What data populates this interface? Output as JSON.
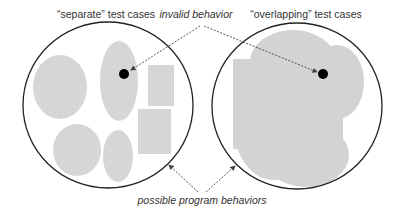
{
  "labels": {
    "separate": "“separate” test cases",
    "invalid": "invalid behavior",
    "overlapping": "“overlapping” test cases",
    "possible": "possible program behaviors"
  },
  "colors": {
    "shape_fill": "#d6d6d6",
    "overlap_fill": "#b5b5b5",
    "outline": "#222222",
    "dot": "#000000",
    "arrow": "#444444"
  }
}
